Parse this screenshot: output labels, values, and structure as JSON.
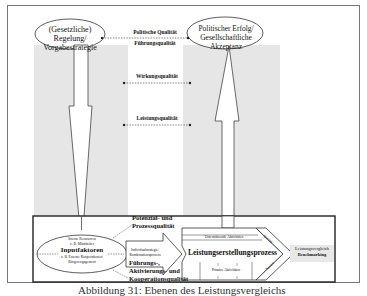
{
  "diagram": {
    "top_left_ellipse": {
      "line1": "(Gesetzliche) Regelung/",
      "line2": "Vorgabestrategie"
    },
    "top_right_ellipse": {
      "line1": "Politischer Erfolg/",
      "line2": "Gesellschaftliche Akzeptanz"
    },
    "quality_labels": {
      "political": "Politische Qualität",
      "leadership": "Führungsqualität",
      "effect": "Wirkungsqualität",
      "performance": "Leistungsqualität"
    },
    "bottom_panel": {
      "input_ellipse": {
        "line1": "Interne Ressourcen",
        "line2": "z. B. Mitarbeiter",
        "title": "Inputfaktoren",
        "line3": "z. B. Externe Kooperationen/",
        "line4": "Bürgerengagement"
      },
      "potential_quality": {
        "line1": "Potenzial- und",
        "line2": "Prozessqualität"
      },
      "combination_arrow": {
        "line1": "Individualstrategie/",
        "line2": "Kombinationsprozess"
      },
      "leadership_quality": {
        "line1": "Führungs-,",
        "line2": "Aktivierungs- und",
        "line3": "Kooperationsqualität"
      },
      "process": {
        "supporting": "Unterstützende Aktivitäten",
        "title": "Leistungserstellungsprozess",
        "primary": "Primäre Aktivitäten",
        "diag_top": "Qualität",
        "diag_bottom": "Kosten"
      },
      "benchmark": {
        "line1": "Leistungsvergleich",
        "line2": "Benchmarking"
      }
    },
    "caption": "Abbildung 31: Ebenen des Leistungsvergleichs"
  },
  "colors": {
    "column_grey": "#e6e6e6",
    "frame": "#777777",
    "line": "#333333"
  }
}
